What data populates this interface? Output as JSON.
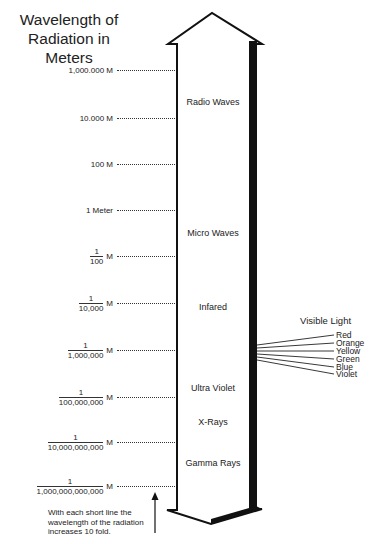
{
  "title": {
    "line1": "Wavelength of",
    "line2": "Radiation in Meters"
  },
  "scale": {
    "ticks": [
      {
        "label": "1,000.000 M",
        "y": 71
      },
      {
        "label": "10.000 M",
        "y": 119
      },
      {
        "label": "100 M",
        "y": 165
      },
      {
        "label": "1 Meter",
        "y": 211
      },
      {
        "num": "1",
        "den": "100",
        "unit": "M",
        "y": 257
      },
      {
        "num": "1",
        "den": "10,000",
        "unit": "M",
        "y": 304
      },
      {
        "num": "1",
        "den": "1,000,000",
        "unit": "M",
        "y": 351
      },
      {
        "num": "1",
        "den": "100,000,000",
        "unit": "M",
        "y": 398
      },
      {
        "num": "1",
        "den": "10,000,000,000",
        "unit": "M",
        "y": 443
      },
      {
        "num": "1",
        "den": "1,000,000,000,000",
        "unit": "M",
        "y": 487
      }
    ]
  },
  "bands": [
    {
      "label": "Radio Waves",
      "y": 103
    },
    {
      "label": "Micro Waves",
      "y": 234
    },
    {
      "label": "Infared",
      "y": 308
    },
    {
      "label": "Ultra Violet",
      "y": 389
    },
    {
      "label": "X-Rays",
      "y": 423
    },
    {
      "label": "Gamma Rays",
      "y": 464
    }
  ],
  "visible_light": {
    "title": "Visible Light",
    "items": [
      "Red",
      "Orange",
      "Yellow",
      "Green",
      "Blue",
      "Violet"
    ]
  },
  "note": {
    "line1": "With each short line the",
    "line2": "wavelength of the radiation",
    "line3": "increases 10 fold."
  },
  "icons": {
    "double_arrow": "double-headed-arrow-icon",
    "pointer_arrow": "up-arrow-icon"
  }
}
